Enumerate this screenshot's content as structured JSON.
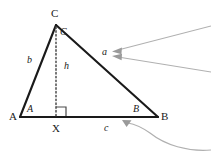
{
  "figure": {
    "background_color": "#ffffff",
    "stroke_color": "#1a1a1a",
    "annotation_color": "#a8a8a8",
    "vertices": {
      "A": {
        "label": "A",
        "x": 20,
        "y": 117
      },
      "B": {
        "label": "B",
        "x": 158,
        "y": 117
      },
      "C": {
        "label": "C",
        "x": 56,
        "y": 25
      },
      "X": {
        "label": "X",
        "x": 56,
        "y": 117
      }
    },
    "vertex_labels": [
      {
        "name": "vertex-label-C",
        "text": "C",
        "x": 51,
        "y": 8
      },
      {
        "name": "vertex-label-A",
        "text": "A",
        "x": 9,
        "y": 112
      },
      {
        "name": "vertex-label-B",
        "text": "B",
        "x": 161,
        "y": 112
      },
      {
        "name": "vertex-label-X",
        "text": "X",
        "x": 52,
        "y": 124
      }
    ],
    "angle_labels": [
      {
        "name": "angle-label-C",
        "text": "C",
        "x": 60,
        "y": 27
      },
      {
        "name": "angle-label-A",
        "text": "A",
        "x": 27,
        "y": 104
      },
      {
        "name": "angle-label-B",
        "text": "B",
        "x": 133,
        "y": 104
      }
    ],
    "side_labels": [
      {
        "name": "side-label-b",
        "text": "b",
        "x": 27,
        "y": 55
      },
      {
        "name": "side-label-a",
        "text": "a",
        "x": 102,
        "y": 47
      },
      {
        "name": "side-label-c",
        "text": "c",
        "x": 104,
        "y": 124
      },
      {
        "name": "side-label-h",
        "text": "h",
        "x": 64,
        "y": 61
      }
    ],
    "elements": {
      "side_b": "segment from A to C",
      "side_a": "segment from C to B",
      "side_c": "segment from A to B",
      "altitude_h": "dotted segment from C to X",
      "right_angle_marker": "square at X"
    },
    "callouts": [
      {
        "name": "callout-arrow-upper-to-side-a",
        "target": "a"
      },
      {
        "name": "callout-arrow-lower-to-side-a",
        "target": "a"
      },
      {
        "name": "callout-arrow-curved-to-side-c",
        "target": "c"
      }
    ]
  }
}
